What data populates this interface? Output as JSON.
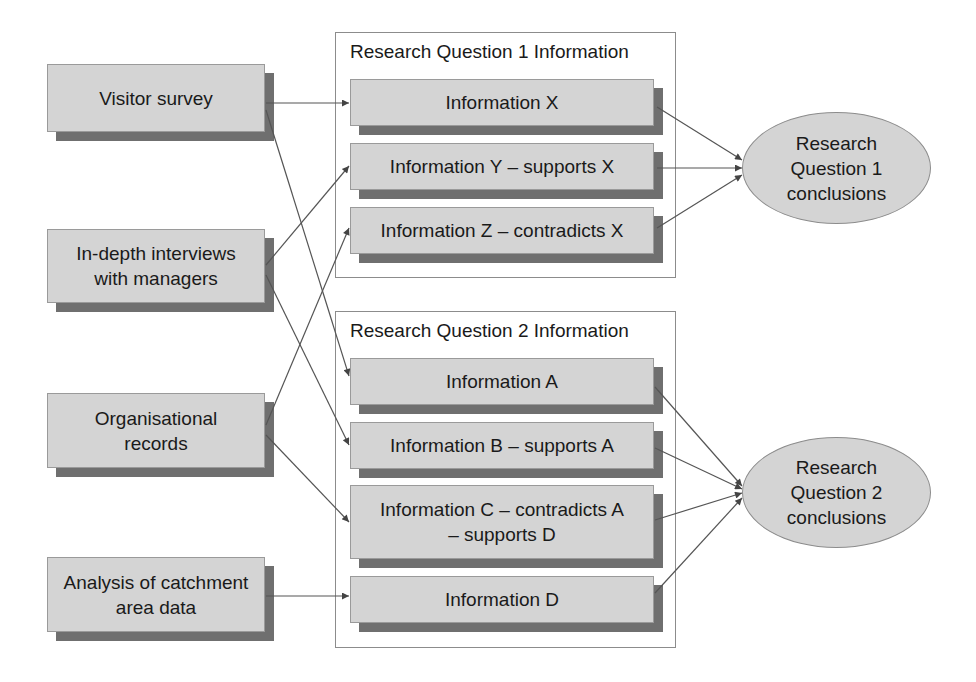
{
  "sources": [
    {
      "id": "visitor-survey",
      "label": "Visitor survey"
    },
    {
      "id": "in-depth-interviews",
      "label": "In-depth interviews\nwith managers"
    },
    {
      "id": "organisational-records",
      "label": "Organisational\nrecords"
    },
    {
      "id": "catchment-analysis",
      "label": "Analysis of catchment\narea data"
    }
  ],
  "groups": [
    {
      "title": "Research Question 1 Information",
      "items": [
        {
          "id": "info-x",
          "label": "Information X"
        },
        {
          "id": "info-y",
          "label": "Information Y – supports X"
        },
        {
          "id": "info-z",
          "label": "Information Z – contradicts X"
        }
      ]
    },
    {
      "title": "Research Question 2 Information",
      "items": [
        {
          "id": "info-a",
          "label": "Information A"
        },
        {
          "id": "info-b",
          "label": "Information B – supports A"
        },
        {
          "id": "info-c",
          "label": "Information C – contradicts A\n– supports D"
        },
        {
          "id": "info-d",
          "label": "Information D"
        }
      ]
    }
  ],
  "conclusions": [
    {
      "id": "rq1-conclusions",
      "label": "Research\nQuestion 1\nconclusions"
    },
    {
      "id": "rq2-conclusions",
      "label": "Research\nQuestion 2\nconclusions"
    }
  ],
  "edges": [
    [
      "visitor-survey",
      "info-x"
    ],
    [
      "visitor-survey",
      "info-a"
    ],
    [
      "in-depth-interviews",
      "info-y"
    ],
    [
      "in-depth-interviews",
      "info-b"
    ],
    [
      "organisational-records",
      "info-z"
    ],
    [
      "organisational-records",
      "info-c"
    ],
    [
      "catchment-analysis",
      "info-d"
    ],
    [
      "info-x",
      "rq1-conclusions"
    ],
    [
      "info-y",
      "rq1-conclusions"
    ],
    [
      "info-z",
      "rq1-conclusions"
    ],
    [
      "info-a",
      "rq2-conclusions"
    ],
    [
      "info-b",
      "rq2-conclusions"
    ],
    [
      "info-c",
      "rq2-conclusions"
    ],
    [
      "info-d",
      "rq2-conclusions"
    ]
  ],
  "colors": {
    "box_fill": "#d4d4d4",
    "box_shadow": "#6f6f6f",
    "line": "#555555",
    "frame": "#8c8c8c"
  }
}
